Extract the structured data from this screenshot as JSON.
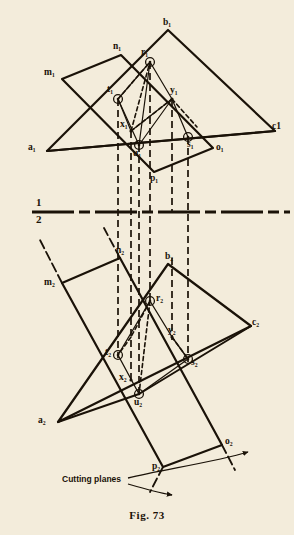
{
  "figure": {
    "caption": "Fig. 73",
    "background_color": "#f3ecdb",
    "ink_color": "#1a1208",
    "type": "descriptive-geometry-orthographic-projection"
  },
  "ground_line": {
    "upper_label": "1",
    "lower_label": "2",
    "style": "thick-dash-dot",
    "y": 212
  },
  "annotations": {
    "cutting_planes_label": "Cutting planes"
  },
  "views": {
    "top_view": {
      "name": "view-1-top",
      "triangle": {
        "name": "triangle-abc-view1",
        "vertices": [
          {
            "id": "a1",
            "label": "a₁",
            "x": 47,
            "y": 151
          },
          {
            "id": "b1",
            "label": "b₁",
            "x": 168,
            "y": 30
          },
          {
            "id": "c1",
            "label": "c1",
            "x": 275,
            "y": 131
          }
        ]
      },
      "parallelogram": {
        "name": "parallelogram-mnop-view1",
        "vertices": [
          {
            "id": "m1",
            "label": "m₁",
            "x": 62,
            "y": 79
          },
          {
            "id": "n1",
            "label": "n₁",
            "x": 121,
            "y": 55
          },
          {
            "id": "o1",
            "label": "o₁",
            "x": 213,
            "y": 148
          },
          {
            "id": "p1",
            "label": "p₁",
            "x": 154,
            "y": 172
          }
        ]
      },
      "points": [
        {
          "id": "r1",
          "label": "r₁",
          "x": 150,
          "y": 62,
          "marker": "circle"
        },
        {
          "id": "t1",
          "label": "t₁",
          "x": 118,
          "y": 99,
          "marker": "circle"
        },
        {
          "id": "y1",
          "label": "y₁",
          "x": 172,
          "y": 99,
          "marker": "none"
        },
        {
          "id": "x1",
          "label": "x₁",
          "x": 131,
          "y": 131,
          "marker": "none"
        },
        {
          "id": "u1",
          "label": "u₁",
          "x": 139,
          "y": 145,
          "marker": "circle"
        },
        {
          "id": "s1",
          "label": "s₁",
          "x": 188,
          "y": 137,
          "marker": "circle"
        }
      ]
    },
    "front_view": {
      "name": "view-2-front",
      "triangle": {
        "name": "triangle-abc-view2",
        "vertices": [
          {
            "id": "a2",
            "label": "a₂",
            "x": 58,
            "y": 422
          },
          {
            "id": "b2",
            "label": "b₂",
            "x": 168,
            "y": 264
          },
          {
            "id": "c2",
            "label": "c₂",
            "x": 251,
            "y": 326
          }
        ]
      },
      "parallelogram": {
        "name": "parallelogram-mnop-view2",
        "vertices": [
          {
            "id": "m2",
            "label": "m₂",
            "x": 62,
            "y": 283
          },
          {
            "id": "n2",
            "label": "n₂",
            "x": 120,
            "y": 258
          },
          {
            "id": "o2",
            "label": "o₂",
            "x": 222,
            "y": 445
          },
          {
            "id": "p2",
            "label": "p₂",
            "x": 163,
            "y": 467
          }
        ]
      },
      "points": [
        {
          "id": "r2",
          "label": "r₂",
          "x": 150,
          "y": 301,
          "marker": "circle"
        },
        {
          "id": "t2",
          "label": "t₂",
          "x": 118,
          "y": 355,
          "marker": "circle"
        },
        {
          "id": "y2",
          "label": "y₂",
          "x": 172,
          "y": 337,
          "marker": "none"
        },
        {
          "id": "x2",
          "label": "x₂",
          "x": 131,
          "y": 380,
          "marker": "none"
        },
        {
          "id": "u2",
          "label": "u₂",
          "x": 139,
          "y": 394,
          "marker": "circle"
        },
        {
          "id": "s2",
          "label": "s₂",
          "x": 188,
          "y": 359,
          "marker": "circle"
        }
      ]
    }
  },
  "projectors": {
    "name": "vertical-projector-lines",
    "style": "dashed",
    "x_positions": [
      118,
      131,
      139,
      150,
      188
    ]
  }
}
